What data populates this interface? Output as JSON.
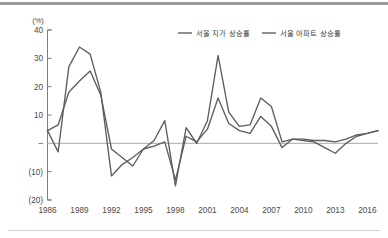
{
  "chart_data": {
    "type": "line",
    "title": "",
    "xlabel": "",
    "ylabel": "",
    "unit_label": "(%)",
    "grid": false,
    "legend_position": "top-center",
    "xlim": [
      1986,
      2017
    ],
    "ylim": [
      -20,
      40
    ],
    "y_ticks": [
      40,
      30,
      20,
      10,
      0,
      -10,
      -20
    ],
    "y_tick_labels": [
      "40",
      "30",
      "20",
      "10",
      "–",
      "(10)",
      "(20)"
    ],
    "x_ticks": [
      1986,
      1989,
      1992,
      1995,
      1998,
      2001,
      2004,
      2007,
      2010,
      2013,
      2016
    ],
    "x_tick_labels": [
      "1986",
      "1989",
      "1992",
      "1995",
      "1998",
      "2001",
      "2004",
      "2007",
      "2010",
      "2013",
      "2016"
    ],
    "x": [
      1986,
      1987,
      1988,
      1989,
      1990,
      1991,
      1992,
      1993,
      1994,
      1995,
      1996,
      1997,
      1998,
      1999,
      2000,
      2001,
      2002,
      2003,
      2004,
      2005,
      2006,
      2007,
      2008,
      2009,
      2010,
      2011,
      2012,
      2013,
      2014,
      2015,
      2016,
      2017
    ],
    "series": [
      {
        "name": "서울 지가 상승률",
        "color": "#5d5d5d",
        "values": [
          4.5,
          6.5,
          18.0,
          22.0,
          25.5,
          17.0,
          -2.0,
          -5.0,
          -8.0,
          -2.0,
          -1.0,
          0.5,
          -13.0,
          2.5,
          0.5,
          5.0,
          16.0,
          7.0,
          4.5,
          3.5,
          9.5,
          6.0,
          -1.5,
          1.5,
          1.0,
          0.5,
          -1.5,
          -3.5,
          0.0,
          2.5,
          3.5,
          4.5
        ]
      },
      {
        "name": "서울 아파트 상승률",
        "color": "#5d5d5d",
        "values": [
          4.5,
          -3.0,
          27.0,
          34.0,
          31.5,
          18.0,
          -11.5,
          -7.5,
          -5.0,
          -2.0,
          1.0,
          8.0,
          -15.0,
          5.5,
          0.0,
          8.0,
          31.0,
          11.0,
          6.0,
          6.5,
          16.0,
          13.0,
          0.5,
          1.5,
          1.5,
          1.0,
          1.0,
          0.5,
          1.5,
          3.0,
          3.5,
          4.5
        ]
      }
    ]
  },
  "legend": {
    "entries": [
      {
        "label": "서울 지가 상승률"
      },
      {
        "label": "서울 아파트 상승률"
      }
    ]
  }
}
